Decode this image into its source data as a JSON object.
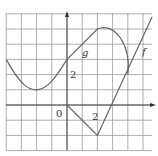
{
  "chart_data": {
    "type": "line",
    "title": "",
    "xlabel": "",
    "ylabel": "",
    "xlim": [
      -4,
      6
    ],
    "ylim": [
      -3,
      6
    ],
    "grid": true,
    "tick_labels": {
      "origin": "0",
      "x": "2",
      "y": "2"
    },
    "series": [
      {
        "name": "g",
        "label": "g",
        "description": "smooth curve from (-4,3) down to min (-2,1), up to (0,3), line to (2,5), then semicircular arc to (4,2)",
        "points": [
          [
            -4,
            3
          ],
          [
            -3,
            1.6
          ],
          [
            -2,
            1
          ],
          [
            -1,
            1.6
          ],
          [
            0,
            3
          ],
          [
            1,
            4
          ],
          [
            2,
            5
          ],
          [
            3,
            4.6
          ],
          [
            3.8,
            3.6
          ],
          [
            4,
            2
          ]
        ]
      },
      {
        "name": "f",
        "label": "f",
        "description": "piecewise linear: (0,0) to (2,-2) then to (5.5,5.5)",
        "points": [
          [
            0,
            0
          ],
          [
            2,
            -2
          ],
          [
            3,
            0
          ],
          [
            4,
            2
          ],
          [
            5,
            4
          ],
          [
            5.6,
            5.8
          ]
        ]
      }
    ]
  },
  "labels": {
    "origin": "0",
    "x_tick": "2",
    "y_tick": "2",
    "g": "g",
    "f": "f"
  }
}
